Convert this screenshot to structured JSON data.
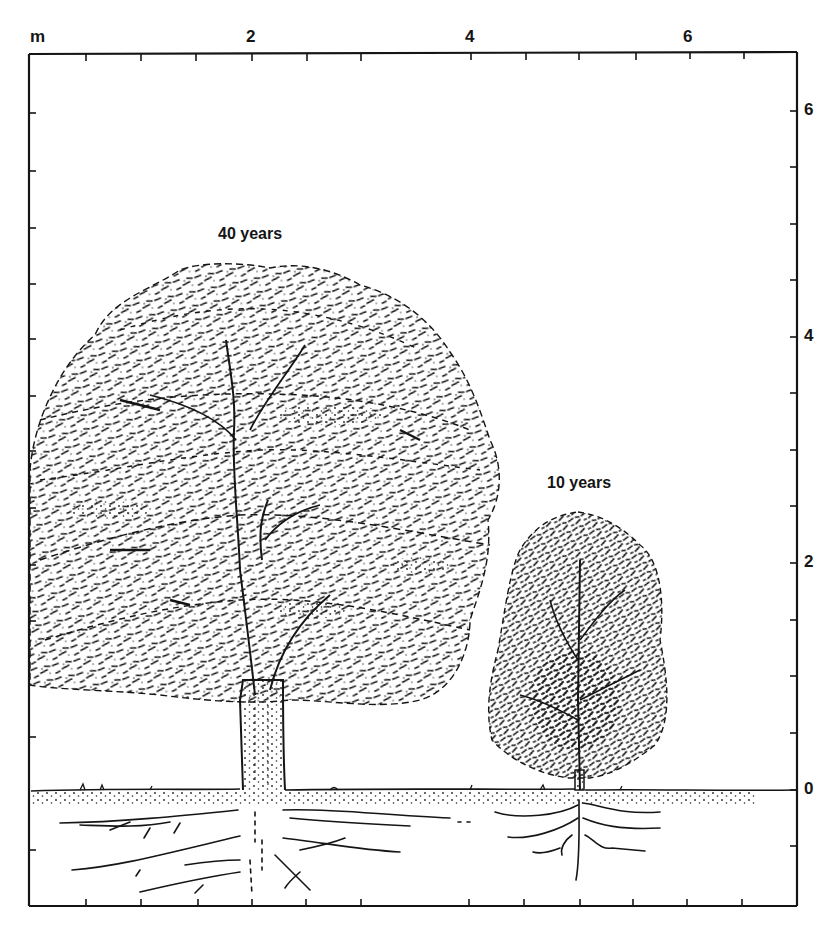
{
  "figure": {
    "type": "scale-illustration",
    "unit_label": "m",
    "ink_color": "#151515",
    "background_color": "#ffffff"
  },
  "axes": {
    "top": {
      "unit": "m",
      "tick_labels": [
        "2",
        "4",
        "6"
      ],
      "tick_label_values": [
        2,
        4,
        6
      ],
      "minor_tick_step": 0.5,
      "range": [
        0,
        7
      ]
    },
    "right": {
      "tick_labels": [
        "6",
        "4",
        "2",
        "0"
      ],
      "tick_label_values": [
        6,
        4,
        2,
        0
      ],
      "minor_tick_step": 0.5,
      "range": [
        -1,
        6.5
      ]
    }
  },
  "trees": [
    {
      "label": "40 years",
      "age_years": 40,
      "approx_height_m": 4.6,
      "approx_crown_width_m": 4.3,
      "trunk_x_m": 2.0,
      "root_depth_m": 0.9
    },
    {
      "label": "10 years",
      "age_years": 10,
      "approx_height_m": 2.5,
      "approx_crown_width_m": 1.6,
      "trunk_x_m": 5.0,
      "root_depth_m": 0.8
    }
  ],
  "ground": {
    "level_m": 0,
    "label": "0"
  }
}
